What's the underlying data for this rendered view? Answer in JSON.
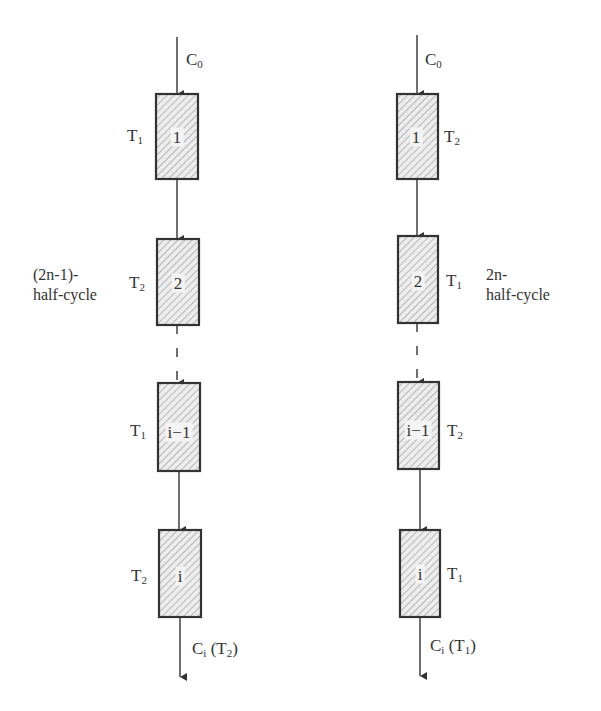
{
  "diagram": {
    "colors": {
      "line": "#333333",
      "hatch": "#9a9a9a",
      "box_fill": "#e6e6e6"
    },
    "columns": [
      {
        "id": "left",
        "phase_label_line1": "(2n-1)-",
        "phase_label_line2": "half-cycle",
        "input_label": "C",
        "input_sub": "0",
        "output_label": "C",
        "output_sub": "i",
        "output_paren_label": "T",
        "output_paren_sub": "2",
        "temp_side": "left",
        "stages": [
          {
            "name": "1",
            "temp": "T",
            "temp_sub": "1"
          },
          {
            "name": "2",
            "temp": "T",
            "temp_sub": "2"
          },
          {
            "name": "i−1",
            "temp": "T",
            "temp_sub": "1"
          },
          {
            "name": "i",
            "temp": "T",
            "temp_sub": "2"
          }
        ]
      },
      {
        "id": "right",
        "phase_label_line1": "2n-",
        "phase_label_line2": "half-cycle",
        "input_label": "C",
        "input_sub": "0",
        "output_label": "C",
        "output_sub": "i",
        "output_paren_label": "T",
        "output_paren_sub": "1",
        "temp_side": "right",
        "stages": [
          {
            "name": "1",
            "temp": "T",
            "temp_sub": "2"
          },
          {
            "name": "2",
            "temp": "T",
            "temp_sub": "1"
          },
          {
            "name": "i−1",
            "temp": "T",
            "temp_sub": "2"
          },
          {
            "name": "i",
            "temp": "T",
            "temp_sub": "1"
          }
        ]
      }
    ]
  }
}
